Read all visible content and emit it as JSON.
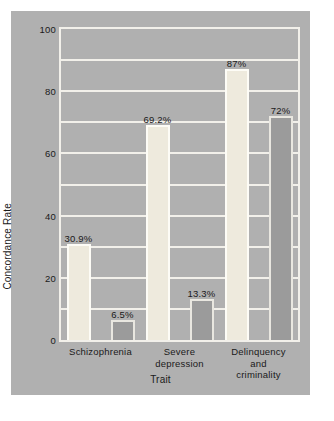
{
  "chart_data": {
    "type": "bar",
    "title": "",
    "subtitle": "",
    "xlabel": "Trait",
    "ylabel": "Concordance Rate",
    "categories": [
      "Schizophrenia",
      "Severe\ndepression",
      "Delinquency\nand criminality"
    ],
    "ylim": [
      0,
      100
    ],
    "y_major_ticks": [
      0,
      20,
      40,
      60,
      80,
      100
    ],
    "y_tick_labels": [
      "0",
      "20",
      "40",
      "60",
      "80",
      "100"
    ],
    "y_minor_gridlines": [
      10,
      30,
      50,
      70,
      90
    ],
    "grid": true,
    "legend": "none",
    "series": [
      {
        "name": "light-bars",
        "color": "#eeeadd",
        "values": [
          30.9,
          69.2,
          87
        ],
        "labels": [
          "30.9%",
          "69.2%",
          "87%"
        ]
      },
      {
        "name": "dark-bars",
        "color": "#9b9b9b",
        "values": [
          6.5,
          13.3,
          72
        ],
        "labels": [
          "6.5%",
          "13.3%",
          "72%"
        ]
      }
    ]
  },
  "colors": {
    "figure_background": "#b0b0b0",
    "plot_background": "#b0b0b0",
    "gridline": "#f2f0ea",
    "frame": "#f2f0ea",
    "light_bar": "#eeeadd",
    "light_bar_edge": "#fdfcf6",
    "dark_bar": "#9b9b9b",
    "dark_bar_edge": "#e9e7e0",
    "text": "#1a1a1a",
    "page_background": "#ffffff"
  }
}
